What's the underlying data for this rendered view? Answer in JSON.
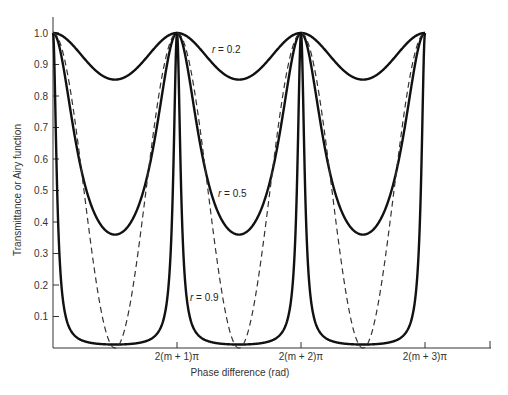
{
  "chart_data": {
    "type": "line",
    "title": "",
    "xlabel": "Phase difference (rad)",
    "ylabel": "Transmittance or Airy function",
    "ylim": [
      0,
      1.0
    ],
    "xlim_periods": [
      0,
      3.5
    ],
    "grid": false,
    "legend": "inline labels",
    "y_ticks": [
      "0.1",
      "0.2",
      "0.3",
      "0.4",
      "0.5",
      "0.6",
      "0.7",
      "0.8",
      "0.9",
      "1.0"
    ],
    "x_ticks": [
      {
        "period": 1,
        "label": "2(m + 1)π"
      },
      {
        "period": 2,
        "label": "2(m + 2)π"
      },
      {
        "period": 3,
        "label": "2(m + 3)π"
      }
    ],
    "series": [
      {
        "name": "r = 0.2",
        "style": "solid",
        "function": "1/(1+F sin^2(δ/2))",
        "r": 0.2,
        "F": 0.1736,
        "min_value": 0.85,
        "max_value": 1.0
      },
      {
        "name": "r = 0.5",
        "style": "solid",
        "function": "1/(1+F sin^2(δ/2))",
        "r": 0.5,
        "F": 1.778,
        "min_value": 0.36,
        "max_value": 1.0
      },
      {
        "name": "r = 0.9",
        "style": "solid",
        "function": "1/(1+F sin^2(δ/2))",
        "r": 0.9,
        "F": 89.75,
        "min_value": 0.011,
        "max_value": 1.0
      },
      {
        "name": "cos² reference",
        "style": "dashed",
        "function": "cos^2(δ/2)",
        "min_value": 0.0,
        "max_value": 1.0
      }
    ],
    "annotations": [
      {
        "text_prefix": "r",
        "text_suffix": " = 0.2",
        "x": 212,
        "y": 53
      },
      {
        "text_prefix": "r",
        "text_suffix": " = 0.5",
        "x": 218,
        "y": 197
      },
      {
        "text_prefix": "r",
        "text_suffix": " = 0.9",
        "x": 190,
        "y": 301
      }
    ]
  }
}
